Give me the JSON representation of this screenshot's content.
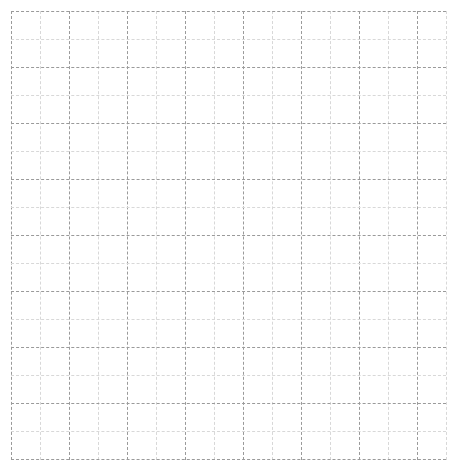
{
  "canvas": {
    "width": 457,
    "height": 472,
    "background_color": "#ffffff"
  },
  "chart_data": {
    "type": "table",
    "title": "",
    "subtitle": "",
    "xlabel": "",
    "ylabel": "",
    "annotations": [],
    "legend": {
      "entries": [],
      "position": "none"
    },
    "grid": {
      "visible": true,
      "style": "dashed",
      "description": "Empty graph-paper style grid with no plotted data, axes labels or tick text",
      "origin_x": 11,
      "origin_y": 11,
      "plot_width": 435,
      "plot_height": 449,
      "cell_width": 29,
      "cell_height": 28,
      "columns": 15,
      "rows": 16,
      "major_every": 2,
      "major_color": "#9a9a9a",
      "minor_color": "#d8d8d8",
      "x_positions": [
        0,
        29,
        58,
        87,
        116,
        145,
        174,
        203,
        232,
        261,
        290,
        319,
        348,
        377,
        406,
        435
      ],
      "y_positions": [
        0,
        28,
        56,
        84,
        112,
        140,
        168,
        196,
        224,
        252,
        280,
        308,
        336,
        364,
        392,
        420,
        448
      ]
    },
    "categories": [],
    "values": [],
    "series": [],
    "xlim": [
      0,
      15
    ],
    "ylim": [
      0,
      16
    ]
  }
}
